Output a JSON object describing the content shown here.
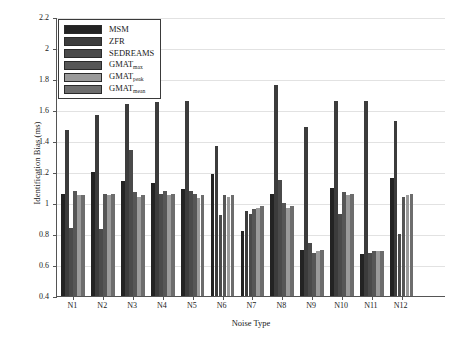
{
  "chart_data": {
    "type": "bar",
    "title": "",
    "xlabel": "Noise Type",
    "ylabel": "Identification Bias (ms)",
    "ylim": [
      0.4,
      2.2
    ],
    "ytick_values": [
      0.4,
      0.6,
      0.8,
      1.0,
      1.2,
      1.4,
      1.6,
      1.8,
      2.0,
      2.2
    ],
    "ytick_labels": [
      "0.4",
      "0.6",
      "0.8",
      "1",
      "1.2",
      "1.4",
      "1.6",
      "1.8",
      "2",
      "2.2"
    ],
    "grid": true,
    "legend_position": "upper left",
    "categories": [
      "N1",
      "N2",
      "N3",
      "N4",
      "N5",
      "N6",
      "N7",
      "N8",
      "N9",
      "N10",
      "N11",
      "N12"
    ],
    "series": [
      {
        "name": "MSM",
        "label_base": "MSM",
        "label_sub": "",
        "color": "#232323",
        "values": [
          1.06,
          1.2,
          1.14,
          1.13,
          1.09,
          1.19,
          0.82,
          1.06,
          0.7,
          1.1,
          0.67,
          1.16
        ]
      },
      {
        "name": "ZFR",
        "label_base": "ZFR",
        "label_sub": "",
        "color": "#3c3c3c",
        "values": [
          1.47,
          1.57,
          1.64,
          1.65,
          1.66,
          1.37,
          0.95,
          1.76,
          1.49,
          1.66,
          1.66,
          1.53
        ]
      },
      {
        "name": "SEDREAMS",
        "label_base": "SEDREAMS",
        "label_sub": "",
        "color": "#4a4a4a",
        "values": [
          0.84,
          0.83,
          1.34,
          1.06,
          1.08,
          0.92,
          0.93,
          1.15,
          0.74,
          0.93,
          0.68,
          0.8
        ]
      },
      {
        "name": "GMAT_max",
        "label_base": "GMAT",
        "label_sub": "max",
        "color": "#565656",
        "values": [
          1.08,
          1.06,
          1.07,
          1.08,
          1.06,
          1.05,
          0.96,
          1.0,
          0.68,
          1.07,
          0.69,
          1.04
        ]
      },
      {
        "name": "GMAT_peak",
        "label_base": "GMAT",
        "label_sub": "peak",
        "color": "#9a9a9a",
        "values": [
          1.05,
          1.05,
          1.04,
          1.05,
          1.03,
          1.04,
          0.97,
          0.97,
          0.69,
          1.05,
          0.69,
          1.05
        ]
      },
      {
        "name": "GMAT_mean",
        "label_base": "GMAT",
        "label_sub": "mean",
        "color": "#6d6d6d",
        "values": [
          1.05,
          1.06,
          1.05,
          1.06,
          1.05,
          1.05,
          0.98,
          0.98,
          0.7,
          1.06,
          0.69,
          1.06
        ]
      }
    ]
  },
  "axis_colors": {
    "axis_line": "#555555",
    "grid_line": "#e2e2e2",
    "legend_border": "#3a3a3a",
    "background": "#ffffff"
  }
}
